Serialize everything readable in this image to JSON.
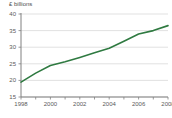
{
  "chart_data": {
    "type": "line",
    "title": "£ billions",
    "xlabel": "",
    "ylabel": "£ billions",
    "grid": true,
    "legend": false,
    "line_color": "#2f7a41",
    "axis_color": "#808080",
    "grid_color": "#d9d9d9",
    "text_color": "#5a5a5a",
    "xlim": [
      1998,
      2008
    ],
    "ylim": [
      15,
      40
    ],
    "yticks": [
      40,
      35,
      30,
      25,
      20,
      15
    ],
    "ytick_labels": [
      "40",
      "35",
      "30",
      "25",
      "20",
      "15"
    ],
    "xticks": [
      1998,
      1999,
      2000,
      2001,
      2002,
      2003,
      2004,
      2005,
      2006,
      2007,
      2008
    ],
    "xtick_labels_shown": [
      "1998",
      "2000",
      "2002",
      "2004",
      "2006",
      "2008"
    ],
    "x": [
      1998,
      1999,
      2000,
      2001,
      2002,
      2003,
      2004,
      2005,
      2006,
      2007,
      2008
    ],
    "values": [
      19.5,
      22.2,
      24.5,
      25.6,
      26.9,
      28.3,
      29.7,
      31.8,
      34.0,
      35.0,
      36.5
    ],
    "series": [
      {
        "name": "Total",
        "values": [
          19.5,
          22.2,
          24.5,
          25.6,
          26.9,
          28.3,
          29.7,
          31.8,
          34.0,
          35.0,
          36.5
        ]
      }
    ]
  }
}
